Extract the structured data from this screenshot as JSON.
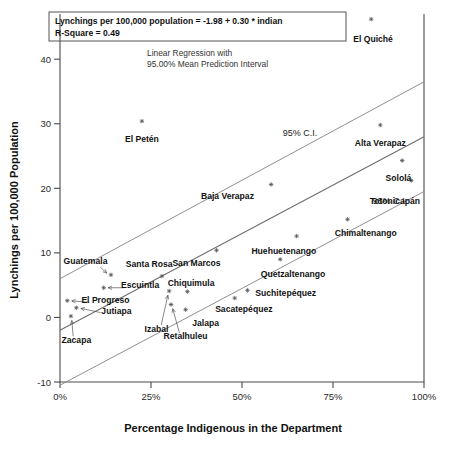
{
  "chart_data": {
    "type": "scatter",
    "title": "",
    "xlabel": "Percentage Indigenous in the Department",
    "ylabel": "Lynchings per 100,000 Population",
    "xlim": [
      0,
      100
    ],
    "ylim": [
      -10,
      47
    ],
    "xticks": [
      0,
      25,
      50,
      75,
      100
    ],
    "xticklabels": [
      "0%",
      "25%",
      "50%",
      "75%",
      "100%"
    ],
    "yticks": [
      -10,
      0,
      10,
      20,
      30,
      40
    ],
    "yticklabels": [
      "-10",
      "0",
      "10",
      "20",
      "30",
      "40"
    ],
    "grid": false,
    "legend": "none",
    "equation": "Lynchings per 100,000 population = -1.98 + 0.30 * indian",
    "r_square_label": "R-Square = 0.49",
    "r_square": 0.49,
    "intercept": -1.98,
    "slope": 0.3,
    "annotation_line1": "Linear Regression with",
    "annotation_line2": "95.00% Mean Prediction Interval",
    "ci_label_upper": "95% C.I.",
    "ci_label_lower": "95% C.I.",
    "points": [
      {
        "name": "El Quiché",
        "x": 85.5,
        "y": 46.2,
        "lx": 86.0,
        "ly": 42.6,
        "anchor": "middle",
        "leader": false
      },
      {
        "name": "El Petén",
        "x": 22.5,
        "y": 30.4,
        "lx": 22.5,
        "ly": 27.2,
        "anchor": "middle",
        "leader": false
      },
      {
        "name": "Alta Verapaz",
        "x": 88.0,
        "y": 29.8,
        "lx": 88.0,
        "ly": 26.6,
        "anchor": "middle",
        "leader": false
      },
      {
        "name": "Sololá",
        "x": 94.0,
        "y": 24.3,
        "lx": 93.0,
        "ly": 21.2,
        "anchor": "middle",
        "leader": false
      },
      {
        "name": "Totonicapán",
        "x": 96.5,
        "y": 21.2,
        "lx": 92.0,
        "ly": 17.6,
        "anchor": "middle",
        "leader": false
      },
      {
        "name": "Baja Verapaz",
        "x": 58.0,
        "y": 20.6,
        "lx": 46.0,
        "ly": 18.4,
        "anchor": "middle",
        "leader": false
      },
      {
        "name": "Chimaltenango",
        "x": 79.0,
        "y": 15.2,
        "lx": 84.0,
        "ly": 12.6,
        "anchor": "middle",
        "leader": false
      },
      {
        "name": "Huehuetenango",
        "x": 65.0,
        "y": 12.6,
        "lx": 61.5,
        "ly": 9.8,
        "anchor": "middle",
        "leader": false
      },
      {
        "name": "Quetzaltenango",
        "x": 60.5,
        "y": 9.0,
        "lx": 64.0,
        "ly": 6.2,
        "anchor": "middle",
        "leader": false
      },
      {
        "name": "San Marcos",
        "x": 43.0,
        "y": 10.4,
        "lx": 37.5,
        "ly": 8.0,
        "anchor": "middle",
        "leader": false
      },
      {
        "name": "Suchitepéquez",
        "x": 51.5,
        "y": 4.2,
        "lx": 62.0,
        "ly": 3.3,
        "anchor": "middle",
        "leader": false
      },
      {
        "name": "Sacatepéquez",
        "x": 48.0,
        "y": 3.0,
        "lx": 50.5,
        "ly": 0.9,
        "anchor": "middle",
        "leader": false
      },
      {
        "name": "Chiquimula",
        "x": 35.0,
        "y": 4.0,
        "lx": 36.0,
        "ly": 4.9,
        "anchor": "middle",
        "leader": false
      },
      {
        "name": "Jalapa",
        "x": 34.5,
        "y": 1.2,
        "lx": 40.0,
        "ly": -1.4,
        "anchor": "middle",
        "leader": false
      },
      {
        "name": "Retalhuleu",
        "x": 30.5,
        "y": 2.0,
        "lx": 34.5,
        "ly": -3.4,
        "anchor": "middle",
        "leader": true
      },
      {
        "name": "Izabal",
        "x": 30.0,
        "y": 4.1,
        "lx": 26.5,
        "ly": -2.2,
        "anchor": "middle",
        "leader": true
      },
      {
        "name": "Santa Rosa",
        "x": 28.0,
        "y": 6.4,
        "lx": 24.5,
        "ly": 7.8,
        "anchor": "middle",
        "leader": true
      },
      {
        "name": "Escuintla",
        "x": 12.0,
        "y": 4.6,
        "lx": 22.0,
        "ly": 4.6,
        "anchor": "middle",
        "leader": true
      },
      {
        "name": "Guatemala",
        "x": 14.0,
        "y": 6.6,
        "lx": 7.0,
        "ly": 8.2,
        "anchor": "middle",
        "leader": true
      },
      {
        "name": "El Progreso",
        "x": 2.0,
        "y": 2.6,
        "lx": 12.5,
        "ly": 2.3,
        "anchor": "middle",
        "leader": true
      },
      {
        "name": "Jutiapa",
        "x": 4.5,
        "y": 1.5,
        "lx": 15.5,
        "ly": 0.6,
        "anchor": "middle",
        "leader": true
      },
      {
        "name": "Zacapa",
        "x": 3.0,
        "y": 0.2,
        "lx": 4.5,
        "ly": -4.0,
        "anchor": "middle",
        "leader": true
      }
    ],
    "fit_line": {
      "x0": 0,
      "y0": -1.98,
      "x1": 100,
      "y1": 28.0
    },
    "ci_upper": {
      "x0": 0,
      "y0": 6.0,
      "x1": 100,
      "y1": 36.5
    },
    "ci_lower": {
      "x0": 0,
      "y0": -10.5,
      "x1": 100,
      "y1": 19.5
    }
  }
}
